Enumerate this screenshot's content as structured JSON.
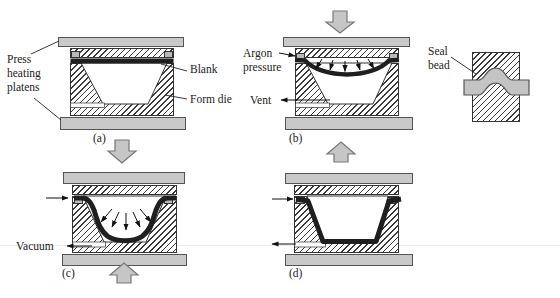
{
  "figure": {
    "labels": {
      "press_heating_platens": "Press heating platens",
      "blank": "Blank",
      "form_die": "Form die",
      "argon_pressure": "Argon pressure",
      "vent": "Vent",
      "vacuum": "Vacuum",
      "seal_bead": "Seal bead",
      "panel_a": "(a)",
      "panel_b": "(b)",
      "panel_c": "(c)",
      "panel_d": "(d)"
    },
    "colors": {
      "platen_gray": "#c9c9c9",
      "block_arrow_gray": "#c6c6c6",
      "seal_band_gray": "#c4c4c4",
      "blank_black": "#1f1f1f",
      "hatch_line": "#3a3a3a",
      "outline": "#333333",
      "background": "#ffffff"
    }
  }
}
